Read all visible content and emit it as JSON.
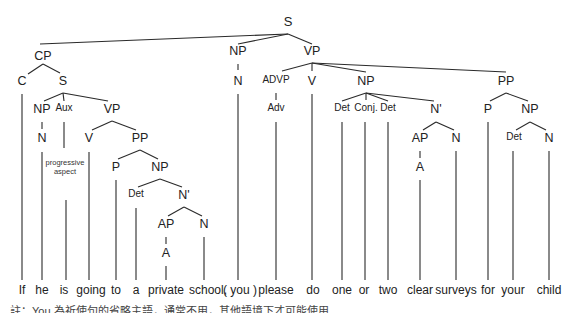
{
  "diagram": {
    "type": "syntax-tree",
    "sentence": [
      "If",
      "he",
      "is",
      "going",
      "to",
      "a",
      "private",
      "school,",
      "( you )",
      "please",
      "do",
      "one",
      "or",
      "two",
      "clear",
      "surveys",
      "for",
      "your",
      "child"
    ],
    "nodes": [
      {
        "id": "S_root",
        "label": "S",
        "x": 288,
        "y": 22,
        "size": "lg"
      },
      {
        "id": "CP",
        "label": "CP",
        "x": 43,
        "y": 57
      },
      {
        "id": "NP_you",
        "label": "NP",
        "x": 238,
        "y": 52
      },
      {
        "id": "VP_main",
        "label": "VP",
        "x": 312,
        "y": 52
      },
      {
        "id": "C",
        "label": "C",
        "x": 22,
        "y": 82
      },
      {
        "id": "S_sub",
        "label": "S",
        "x": 63,
        "y": 82
      },
      {
        "id": "N_you",
        "label": "N",
        "x": 238,
        "y": 82
      },
      {
        "id": "ADVP",
        "label": "ADVP",
        "x": 276,
        "y": 82,
        "size": "sm"
      },
      {
        "id": "V_do",
        "label": "V",
        "x": 312,
        "y": 82
      },
      {
        "id": "NP_obj",
        "label": "NP",
        "x": 366,
        "y": 82
      },
      {
        "id": "PP_for",
        "label": "PP",
        "x": 506,
        "y": 82
      },
      {
        "id": "NP_he",
        "label": "NP",
        "x": 42,
        "y": 110
      },
      {
        "id": "Aux",
        "label": "Aux",
        "x": 64,
        "y": 110,
        "size": "sm"
      },
      {
        "id": "VP_sub",
        "label": "VP",
        "x": 112,
        "y": 110
      },
      {
        "id": "Adv",
        "label": "Adv",
        "x": 276,
        "y": 110,
        "size": "sm"
      },
      {
        "id": "Det1",
        "label": "Det",
        "x": 342,
        "y": 110,
        "size": "sm"
      },
      {
        "id": "Conj",
        "label": "Conj.",
        "x": 366,
        "y": 110,
        "size": "sm"
      },
      {
        "id": "Det2",
        "label": "Det",
        "x": 388,
        "y": 110,
        "size": "sm"
      },
      {
        "id": "Nbar_obj",
        "label": "N'",
        "x": 436,
        "y": 110
      },
      {
        "id": "P_for",
        "label": "P",
        "x": 488,
        "y": 110
      },
      {
        "id": "NP_child",
        "label": "NP",
        "x": 530,
        "y": 110
      },
      {
        "id": "N_he",
        "label": "N",
        "x": 42,
        "y": 139
      },
      {
        "id": "V_going",
        "label": "V",
        "x": 89,
        "y": 139
      },
      {
        "id": "PP_to",
        "label": "PP",
        "x": 140,
        "y": 139
      },
      {
        "id": "AP_obj",
        "label": "AP",
        "x": 420,
        "y": 139
      },
      {
        "id": "N_surveys",
        "label": "N",
        "x": 456,
        "y": 139
      },
      {
        "id": "Det_your",
        "label": "Det",
        "x": 514,
        "y": 139,
        "size": "sm"
      },
      {
        "id": "N_child",
        "label": "N",
        "x": 549,
        "y": 139
      },
      {
        "id": "P_to",
        "label": "P",
        "x": 116,
        "y": 168
      },
      {
        "id": "NP_school",
        "label": "NP",
        "x": 160,
        "y": 168
      },
      {
        "id": "A_clear",
        "label": "A",
        "x": 420,
        "y": 168
      },
      {
        "id": "Det_a",
        "label": "Det",
        "x": 136,
        "y": 196,
        "size": "sm"
      },
      {
        "id": "Nbar_school",
        "label": "N'",
        "x": 184,
        "y": 196
      },
      {
        "id": "AP_school",
        "label": "AP",
        "x": 166,
        "y": 225
      },
      {
        "id": "N_school",
        "label": "N",
        "x": 204,
        "y": 225
      },
      {
        "id": "A_private",
        "label": "A",
        "x": 166,
        "y": 254
      }
    ],
    "annotation": {
      "text_line1": "progressive",
      "text_line2": "aspect",
      "x": 65,
      "y": 164
    },
    "words": [
      {
        "text": "If",
        "x": 22
      },
      {
        "text": "he",
        "x": 42
      },
      {
        "text": "is",
        "x": 64
      },
      {
        "text": "going",
        "x": 91
      },
      {
        "text": "to",
        "x": 116
      },
      {
        "text": "a",
        "x": 136
      },
      {
        "text": "private",
        "x": 166
      },
      {
        "text": "school,",
        "x": 208
      },
      {
        "text": "( you )",
        "x": 240
      },
      {
        "text": "please",
        "x": 276
      },
      {
        "text": "do",
        "x": 313
      },
      {
        "text": "one",
        "x": 342
      },
      {
        "text": "or",
        "x": 364
      },
      {
        "text": "two",
        "x": 388
      },
      {
        "text": "clear",
        "x": 420
      },
      {
        "text": "surveys",
        "x": 456
      },
      {
        "text": "for",
        "x": 488
      },
      {
        "text": "your",
        "x": 513
      },
      {
        "text": "child",
        "x": 549
      }
    ],
    "words_y": 284,
    "caption": "註：You 為祈使句的省略主語，通常不用，其他語境下才可能使用"
  }
}
